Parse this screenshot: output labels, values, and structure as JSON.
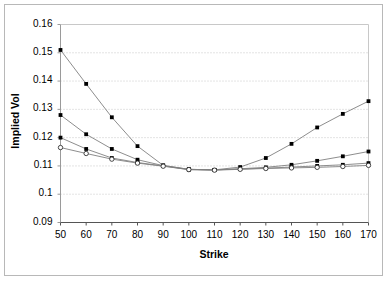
{
  "chart_data": {
    "type": "line",
    "title": "",
    "xlabel": "Strike",
    "ylabel": "Implied Vol",
    "x": [
      50,
      60,
      70,
      80,
      90,
      100,
      110,
      120,
      130,
      140,
      150,
      160,
      170
    ],
    "xlim": [
      50,
      170
    ],
    "ylim": [
      0.09,
      0.16
    ],
    "yticks": [
      "0.09",
      "0.1",
      "0.11",
      "0.12",
      "0.13",
      "0.14",
      "0.15",
      "0.16"
    ],
    "ytick_values": [
      0.09,
      0.1,
      0.11,
      0.12,
      0.13,
      0.14,
      0.15,
      0.16
    ],
    "xticks": [
      "50",
      "60",
      "70",
      "80",
      "90",
      "100",
      "110",
      "120",
      "130",
      "140",
      "150",
      "160",
      "170"
    ],
    "grid": "horizontal-dotted",
    "legend": "none",
    "series": [
      {
        "name": "series-1",
        "marker": "filled-square",
        "values": [
          0.151,
          0.139,
          0.1272,
          0.117,
          0.1102,
          0.1088,
          0.1086,
          0.1096,
          0.1128,
          0.1178,
          0.1236,
          0.1284,
          0.1329
        ]
      },
      {
        "name": "series-2",
        "marker": "filled-square",
        "values": [
          0.128,
          0.1212,
          0.116,
          0.1122,
          0.1101,
          0.1088,
          0.1086,
          0.109,
          0.1095,
          0.1104,
          0.1118,
          0.1134,
          0.1151
        ]
      },
      {
        "name": "series-3",
        "marker": "filled-square",
        "values": [
          0.12,
          0.116,
          0.1128,
          0.1112,
          0.11,
          0.1087,
          0.1086,
          0.1089,
          0.1092,
          0.1096,
          0.11,
          0.1104,
          0.111
        ]
      },
      {
        "name": "series-4",
        "marker": "open-circle",
        "values": [
          0.1165,
          0.1144,
          0.1124,
          0.111,
          0.1099,
          0.1087,
          0.1085,
          0.1088,
          0.1091,
          0.1093,
          0.1095,
          0.1098,
          0.1102
        ]
      }
    ],
    "colors": {
      "line": "#808080",
      "marker_fill": "#000000",
      "marker_open_fill": "#ffffff",
      "grid": "#c8c8c8",
      "axis": "#9a9a9a",
      "text": "#000000",
      "border": "#b8b8b8"
    }
  }
}
